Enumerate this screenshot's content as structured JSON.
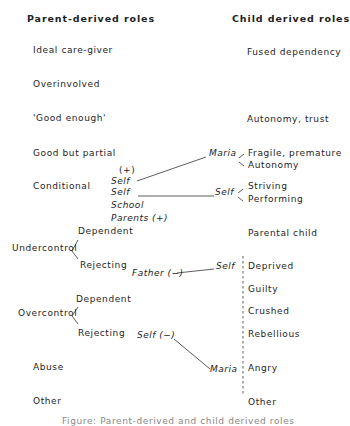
{
  "headers": {
    "parent": "Parent-derived roles",
    "child": "Child derived roles"
  },
  "parent_roles": {
    "ideal": "Ideal care-giver",
    "overinvolved": "Overinvolved",
    "good_enough": "'Good enough'",
    "good_partial": "Good but partial",
    "conditional": "Conditional",
    "undercontrol": "Undercontrol",
    "undercontrol_dependent": "Dependent",
    "undercontrol_rejecting": "Rejecting",
    "overcontrol": "Overcontrol",
    "overcontrol_dependent": "Dependent",
    "overcontrol_rejecting": "Rejecting",
    "abuse": "Abuse",
    "other": "Other"
  },
  "conditional_sources": {
    "plus_top": "(+)",
    "self1": "Self",
    "self2": "Self",
    "school": "School",
    "parents": "Parents (+)"
  },
  "intermediates": {
    "maria_top": "Maria",
    "self_mid": "Self",
    "father": "Father (−)",
    "self_father": "Self",
    "self_minus": "Self (−)",
    "maria_bottom": "Maria"
  },
  "child_roles": {
    "fused": "Fused dependency",
    "autonomy_trust": "Autonomy, trust",
    "fragile": "Fragile, premature",
    "autonomy": "Autonomy",
    "striving": "Striving",
    "performing": "Performing",
    "parental_child": "Parental child",
    "deprived": "Deprived",
    "guilty": "Guilty",
    "crushed": "Crushed",
    "rebellious": "Rebellious",
    "angry": "Angry",
    "other": "Other"
  },
  "caption": "Figure: Parent-derived and child derived roles"
}
